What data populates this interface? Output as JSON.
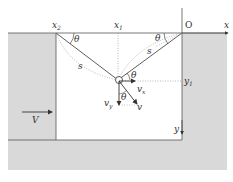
{
  "labels": {
    "origin": "O",
    "x_axis": "x",
    "y_axis": "y",
    "x1": "x",
    "x1_sub": "1",
    "x2": "x",
    "x2_sub": "2",
    "y1": "y",
    "y1_sub": "1",
    "theta_left": "θ",
    "theta_right": "θ",
    "theta_particle": "θ",
    "theta_velocity": "θ",
    "s_left": "s",
    "s_right": "s",
    "vx": "v",
    "vx_sub": "x",
    "vy": "v",
    "vy_sub": "y",
    "v": "v",
    "V": "V"
  },
  "colors": {
    "wall": "#d9d9d9",
    "edge": "#555555",
    "line": "#333333",
    "dotted": "#888888"
  }
}
